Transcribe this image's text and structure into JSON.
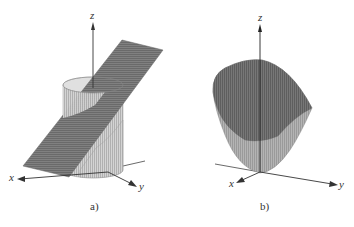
{
  "figure_a": {
    "caption": "a)",
    "axes": {
      "x": "x",
      "y": "y",
      "z": "z"
    },
    "description": "Cylinder cut by an inclined plane"
  },
  "figure_b": {
    "caption": "b)",
    "axes": {
      "x": "x",
      "y": "y",
      "z": "z"
    },
    "description": "Paraboloid-like bowl surface"
  },
  "colors": {
    "plane": "#7a7a7a",
    "cylinder": "#c8c8c8",
    "bowl_outer": "#a8a8a8",
    "bowl_inner": "#6e6e6e",
    "axis": "#333333"
  }
}
